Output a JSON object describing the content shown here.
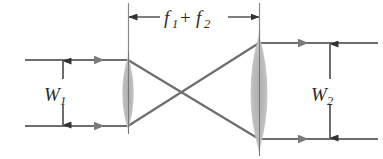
{
  "figure": {
    "type": "optical-ray-diagram",
    "background_color": "#ffffff",
    "ray_color": "#6e6e6e",
    "line_color": "#555555",
    "lens_fill_color": "#b9b9b9",
    "text_color": "#2b2b2b"
  },
  "labels": {
    "separation": {
      "name": "f1 + f2",
      "symbol_1": "f",
      "subscript_1": "1",
      "operator": "+",
      "symbol_2": "f",
      "subscript_2": "2"
    },
    "input_width": {
      "name": "W1",
      "symbol": "W",
      "subscript": "1"
    },
    "output_width": {
      "name": "W2",
      "symbol": "W",
      "subscript": "2"
    }
  },
  "geometry": {
    "lens1": {
      "center_x": 128,
      "top_y": 56,
      "bottom_y": 130,
      "half_width": 11
    },
    "lens2": {
      "center_x": 259,
      "top_y": 34,
      "bottom_y": 152,
      "half_width": 17
    },
    "input_rays": {
      "top_y": 60,
      "bottom_y": 126,
      "start_x": 25,
      "end_x": 128,
      "arrow_x": 103
    },
    "output_rays": {
      "top_y": 43,
      "bottom_y": 139,
      "start_x": 259,
      "end_x": 378,
      "arrow_x": 307
    },
    "dimension_line": {
      "y": 17,
      "left_x": 128,
      "right_x": 259,
      "extension_left_bottom_y": 58,
      "extension_right_bottom_y": 36
    },
    "w1_arrow": {
      "x": 63,
      "top_y": 61,
      "bottom_y": 125
    },
    "w2_arrow": {
      "x": 330,
      "top_y": 44,
      "bottom_y": 138
    }
  }
}
